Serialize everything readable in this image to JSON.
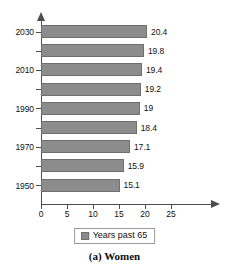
{
  "chart_data": {
    "type": "bar",
    "orientation": "horizontal",
    "title": "",
    "caption": "(a) Women",
    "xlabel": "",
    "ylabel": "",
    "xlim": [
      0,
      25
    ],
    "xticks": [
      0,
      5,
      10,
      15,
      20,
      25
    ],
    "xtick_labels": [
      "0",
      "5",
      "10",
      "15",
      "20",
      "25"
    ],
    "grid": false,
    "categories": [
      "2030",
      "2020",
      "2010",
      "2000",
      "1990",
      "1980",
      "1970",
      "1960",
      "1950"
    ],
    "visible_category_labels": [
      "2030",
      "",
      "2010",
      "",
      "1990",
      "",
      "1970",
      "",
      "1950"
    ],
    "values": [
      20.4,
      19.8,
      19.4,
      19.2,
      19,
      18.4,
      17.1,
      15.9,
      15.1
    ],
    "value_labels": [
      "20.4",
      "19.8",
      "19.4",
      "19.2",
      "19",
      "18.4",
      "17.1",
      "15.9",
      "15.1"
    ],
    "series": [
      {
        "name": "Years past 65",
        "values": [
          20.4,
          19.8,
          19.4,
          19.2,
          19,
          18.4,
          17.1,
          15.9,
          15.1
        ]
      }
    ],
    "legend": {
      "position": "bottom-center",
      "entries": [
        "Years past 65"
      ]
    },
    "colors": {
      "bar_fill": "#8c8c8c",
      "bar_stroke": "#6f6f6f",
      "axis": "#4d4d4d",
      "text": "#111111",
      "background": "#ffffff"
    }
  }
}
